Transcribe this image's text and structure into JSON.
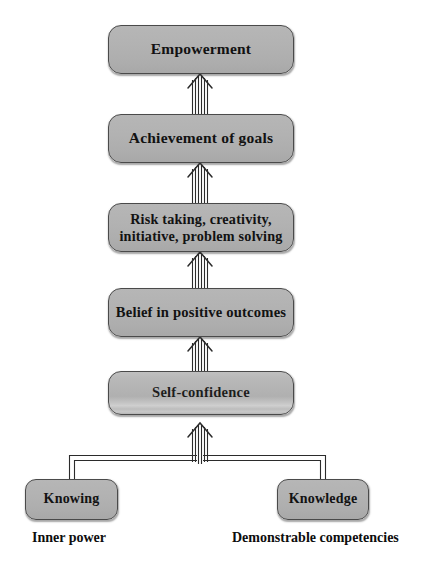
{
  "diagram": {
    "type": "flow-hierarchy",
    "orientation": "bottom-up",
    "colors": {
      "box_fill": "#b2b2b2",
      "box_border": "#4a4a4a",
      "text": "#121212",
      "connector": "#2b2b2b",
      "background": "#ffffff"
    },
    "nodes": {
      "empowerment": "Empowerment",
      "achievement": "Achievement of goals",
      "risk": "Risk taking, creativity,\ninitiative, problem solving",
      "belief": "Belief in positive outcomes",
      "self_confidence": "Self-confidence",
      "knowing": "Knowing",
      "knowledge": "Knowledge"
    },
    "captions": {
      "inner_power": "Inner power",
      "demonstrable_competencies": "Demonstrable competencies"
    },
    "flow_sequence": [
      "Knowing",
      "Knowledge",
      "Self-confidence",
      "Belief in positive outcomes",
      "Risk taking, creativity, initiative, problem solving",
      "Achievement of goals",
      "Empowerment"
    ],
    "connectors": [
      {
        "from": "self_confidence",
        "to": "belief",
        "style": "striped-arrow-up"
      },
      {
        "from": "belief",
        "to": "risk",
        "style": "striped-arrow-up"
      },
      {
        "from": "risk",
        "to": "achievement",
        "style": "striped-arrow-up"
      },
      {
        "from": "achievement",
        "to": "empowerment",
        "style": "striped-arrow-up"
      },
      {
        "from": "knowing",
        "to": "self_confidence",
        "style": "double-line-elbow"
      },
      {
        "from": "knowledge",
        "to": "self_confidence",
        "style": "double-line-elbow"
      }
    ]
  }
}
